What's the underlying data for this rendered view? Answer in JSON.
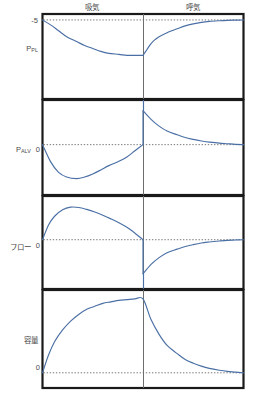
{
  "figure": {
    "title_present": false,
    "colors": {
      "curve": "#4a6fa5",
      "frame": "#1a1a1a",
      "divider": "#6e6e6e",
      "baseline_dotted": "#555555",
      "text": "#4a4a4a",
      "background": "#ffffff"
    }
  },
  "phases": {
    "inspiration": "吸気",
    "expiration": "呼気"
  },
  "panels": [
    {
      "id": "ppl",
      "label_main": "P",
      "label_sub": "PL",
      "tick_label": "-5",
      "tick_value": -5
    },
    {
      "id": "palv",
      "label_main": "P",
      "label_sub": "ALV",
      "tick_label": "0",
      "tick_value": 0
    },
    {
      "id": "flow",
      "label_main": "フロー",
      "label_sub": "",
      "tick_label": "0",
      "tick_value": 0
    },
    {
      "id": "volume",
      "label_main": "容量",
      "label_sub": "",
      "tick_label": "0",
      "tick_value": 0
    }
  ],
  "chart_data": {
    "type": "line",
    "title": "",
    "xlabel": "",
    "ylabel": "",
    "grid": false,
    "legend": "none",
    "x_phase_split": 0.5,
    "x_annotations": [
      "吸気",
      "呼気"
    ],
    "subplots": [
      {
        "name": "ppl",
        "ylabel": "P_PL",
        "ytick_labels": [
          "-5"
        ],
        "ytick_values": [
          -5
        ],
        "baseline_dotted_at": -5,
        "series": [
          {
            "name": "pleural pressure",
            "x": [
              0.0,
              0.04,
              0.08,
              0.12,
              0.17,
              0.21,
              0.25,
              0.29,
              0.33,
              0.38,
              0.42,
              0.46,
              0.5,
              0.5,
              0.52,
              0.54,
              0.56,
              0.58,
              0.62,
              0.67,
              0.71,
              0.75,
              0.79,
              0.83,
              0.88,
              0.92,
              0.96,
              1.0
            ],
            "y": [
              -5.0,
              -5.5,
              -6.1,
              -6.7,
              -7.2,
              -7.6,
              -7.9,
              -8.2,
              -8.4,
              -8.5,
              -8.6,
              -8.6,
              -8.6,
              -8.6,
              -8.0,
              -7.4,
              -7.0,
              -6.7,
              -6.3,
              -5.9,
              -5.6,
              -5.4,
              -5.25,
              -5.15,
              -5.08,
              -5.04,
              -5.02,
              -5.0
            ],
            "color": "#4a6fa5"
          }
        ]
      },
      {
        "name": "palv",
        "ylabel": "P_ALV",
        "ytick_labels": [
          "0"
        ],
        "ytick_values": [
          0
        ],
        "baseline_dotted_at": 0,
        "series": [
          {
            "name": "alveolar pressure",
            "x": [
              0.0,
              0.04,
              0.08,
              0.12,
              0.17,
              0.21,
              0.25,
              0.29,
              0.33,
              0.38,
              0.42,
              0.46,
              0.5,
              0.5,
              0.54,
              0.58,
              0.62,
              0.67,
              0.71,
              0.75,
              0.79,
              0.83,
              0.88,
              0.92,
              0.96,
              1.0
            ],
            "y": [
              0.0,
              -0.55,
              -0.9,
              -1.05,
              -1.1,
              -1.05,
              -0.95,
              -0.82,
              -0.68,
              -0.54,
              -0.4,
              -0.2,
              0.0,
              1.1,
              0.82,
              0.6,
              0.44,
              0.32,
              0.23,
              0.17,
              0.12,
              0.08,
              0.05,
              0.03,
              0.01,
              0.0
            ],
            "color": "#4a6fa5"
          }
        ]
      },
      {
        "name": "flow",
        "ylabel": "フロー",
        "ytick_labels": [
          "0"
        ],
        "ytick_values": [
          0
        ],
        "baseline_dotted_at": 0,
        "series": [
          {
            "name": "airflow",
            "x": [
              0.0,
              0.03,
              0.06,
              0.1,
              0.14,
              0.18,
              0.22,
              0.26,
              0.3,
              0.34,
              0.38,
              0.42,
              0.46,
              0.5,
              0.5,
              0.54,
              0.58,
              0.62,
              0.67,
              0.71,
              0.75,
              0.79,
              0.83,
              0.88,
              0.92,
              0.96,
              1.0
            ],
            "y": [
              0.0,
              0.45,
              0.72,
              0.92,
              1.0,
              0.99,
              0.93,
              0.85,
              0.75,
              0.64,
              0.52,
              0.38,
              0.2,
              0.0,
              -1.05,
              -0.76,
              -0.55,
              -0.4,
              -0.29,
              -0.21,
              -0.15,
              -0.1,
              -0.07,
              -0.04,
              -0.02,
              -0.01,
              0.0
            ],
            "color": "#4a6fa5"
          }
        ]
      },
      {
        "name": "volume",
        "ylabel": "容量",
        "ytick_labels": [
          "0"
        ],
        "ytick_values": [
          0
        ],
        "baseline_dotted_at": 0,
        "series": [
          {
            "name": "lung volume",
            "x": [
              0.0,
              0.03,
              0.06,
              0.1,
              0.14,
              0.18,
              0.22,
              0.26,
              0.3,
              0.34,
              0.38,
              0.42,
              0.46,
              0.5,
              0.54,
              0.58,
              0.62,
              0.67,
              0.71,
              0.75,
              0.79,
              0.83,
              0.88,
              0.92,
              0.96,
              1.0
            ],
            "y": [
              0.0,
              0.24,
              0.42,
              0.58,
              0.7,
              0.79,
              0.86,
              0.9,
              0.94,
              0.96,
              0.98,
              0.99,
              1.0,
              1.0,
              0.72,
              0.52,
              0.37,
              0.26,
              0.18,
              0.13,
              0.09,
              0.06,
              0.035,
              0.02,
              0.01,
              0.0
            ],
            "color": "#4a6fa5"
          }
        ]
      }
    ]
  }
}
